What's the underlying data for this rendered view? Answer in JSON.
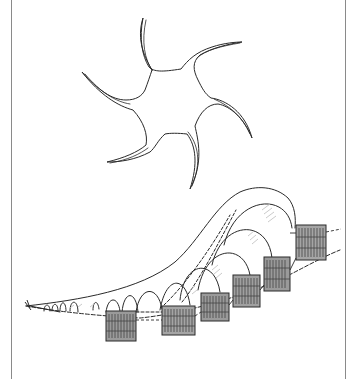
{
  "figure": {
    "description": "Hand-drawn pencil sketch: a five/six-armed star shape above a receding tunnel of arches with hatched rectangular panels",
    "colors": {
      "background": "#ffffff",
      "border": "#8a8a8a",
      "ink": "#2a2a2a",
      "hatch": "#555555",
      "shade": "#bdbdbd"
    },
    "star": {
      "center": [
        170,
        97
      ],
      "arm_tips": [
        [
          143,
          18
        ],
        [
          242,
          42
        ],
        [
          252,
          138
        ],
        [
          190,
          189
        ],
        [
          107,
          162
        ],
        [
          82,
          72
        ]
      ]
    },
    "tunnel": {
      "left_tip": [
        26,
        306
      ],
      "arch_count": 11,
      "largest_arch_top": [
        265,
        190
      ]
    },
    "panels": [
      {
        "x": 106,
        "y": 311,
        "w": 30,
        "h": 30
      },
      {
        "x": 162,
        "y": 306,
        "w": 33,
        "h": 29
      },
      {
        "x": 201,
        "y": 293,
        "w": 28,
        "h": 28
      },
      {
        "x": 233,
        "y": 275,
        "w": 27,
        "h": 32
      },
      {
        "x": 264,
        "y": 257,
        "w": 26,
        "h": 34
      },
      {
        "x": 296,
        "y": 225,
        "w": 30,
        "h": 35
      }
    ]
  }
}
